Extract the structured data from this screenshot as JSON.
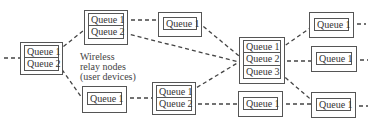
{
  "diagram": {
    "description_label": [
      "Wireless",
      "relay nodes",
      "(user devices)"
    ],
    "colors": {
      "line": "#444444",
      "box": "#555555",
      "text": "#333333"
    },
    "nodes": [
      {
        "id": "A",
        "queues": [
          "Queue 1",
          "Queue 2"
        ]
      },
      {
        "id": "B",
        "queues": [
          "Queue 1",
          "Queue 2"
        ]
      },
      {
        "id": "C",
        "queues": [
          "Queue 1"
        ]
      },
      {
        "id": "D",
        "queues": [
          "Queue 1"
        ]
      },
      {
        "id": "E",
        "queues": [
          "Queue 1",
          "Queue 2"
        ]
      },
      {
        "id": "F",
        "queues": [
          "Queue 1",
          "Queue 2",
          "Queue 3"
        ]
      },
      {
        "id": "G",
        "queues": [
          "Queue 1"
        ]
      },
      {
        "id": "H",
        "queues": [
          "Queue 1"
        ]
      },
      {
        "id": "I",
        "queues": [
          "Queue 1"
        ]
      },
      {
        "id": "J",
        "queues": [
          "Queue 1"
        ]
      }
    ],
    "edges": [
      [
        "input",
        "A"
      ],
      [
        "A.Q1",
        "B"
      ],
      [
        "A.Q2",
        "D"
      ],
      [
        "B.Q1",
        "C"
      ],
      [
        "B.Q2",
        "F"
      ],
      [
        "C",
        "F"
      ],
      [
        "D",
        "E"
      ],
      [
        "E.Q1",
        "F"
      ],
      [
        "E.Q2",
        "J"
      ],
      [
        "F.Q1",
        "G"
      ],
      [
        "F.Q2",
        "H"
      ],
      [
        "F.Q3",
        "I"
      ],
      [
        "J",
        "I"
      ],
      [
        "G",
        "output"
      ],
      [
        "H",
        "output"
      ],
      [
        "I",
        "output"
      ]
    ]
  }
}
